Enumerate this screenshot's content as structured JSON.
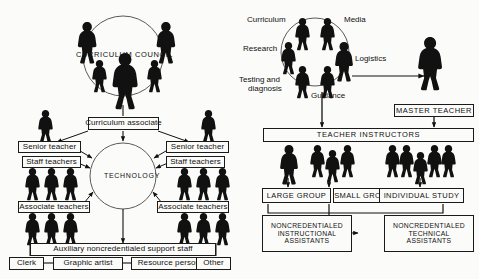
{
  "figure": {
    "type": "organizational-diagram",
    "background_color": "#fbfbf9",
    "ink_color": "#111111"
  },
  "left_diagram": {
    "name": "curriculum-technology-structure",
    "council_circle": {
      "label": "CURRICULUM COUNCIL",
      "member_count": 5,
      "lead_figure": 1
    },
    "center_circle": {
      "label": "TECHNOLOGY"
    },
    "boxes": {
      "curriculum_associate": "Curriculum associate",
      "senior_teacher_left": "Senior teacher",
      "senior_teacher_right": "Senior teacher",
      "staff_teachers_left": "Staff teachers",
      "staff_teachers_right": "Staff teachers",
      "associate_teachers_left": "Associate teachers",
      "associate_teachers_right": "Associate teachers",
      "auxiliary": "Auxiliary noncredentialed support staff"
    },
    "support_roles": [
      "Clerk",
      "Graphic artist",
      "Resource persons",
      "Other"
    ],
    "figure_groups": {
      "senior_left": 1,
      "senior_right": 1,
      "staff_left": 3,
      "staff_right": 3,
      "associate_left": 3,
      "associate_right": 3
    }
  },
  "right_diagram": {
    "name": "teacher-instructor-structure",
    "service_circle": {
      "member_count": 6,
      "labels": [
        "Curriculum",
        "Media",
        "Logistics",
        "Guidance",
        "Testing and diagnosis",
        "Research"
      ],
      "label_testing_line1": "Testing and",
      "label_testing_line2": "diagnosis"
    },
    "boxes": {
      "master_teacher": "MASTER TEACHER",
      "teacher_instructors": "TEACHER INSTRUCTORS",
      "large_group": "LARGE GROUP",
      "small_groups": "SMALL GROUPS",
      "individual_study": "INDIVIDUAL STUDY"
    },
    "assistant_boxes": {
      "instructional": {
        "line1": "NONCREDENTIALED",
        "line2": "INSTRUCTIONAL",
        "line3": "ASSISTANTS"
      },
      "technical": {
        "line1": "NONCREDENTIALED",
        "line2": "TECHNICAL",
        "line3": "ASSISTANTS"
      }
    },
    "figure_groups": {
      "large_group": 1,
      "small_groups": 3,
      "individual_study": 5,
      "master_teacher": 1
    }
  }
}
